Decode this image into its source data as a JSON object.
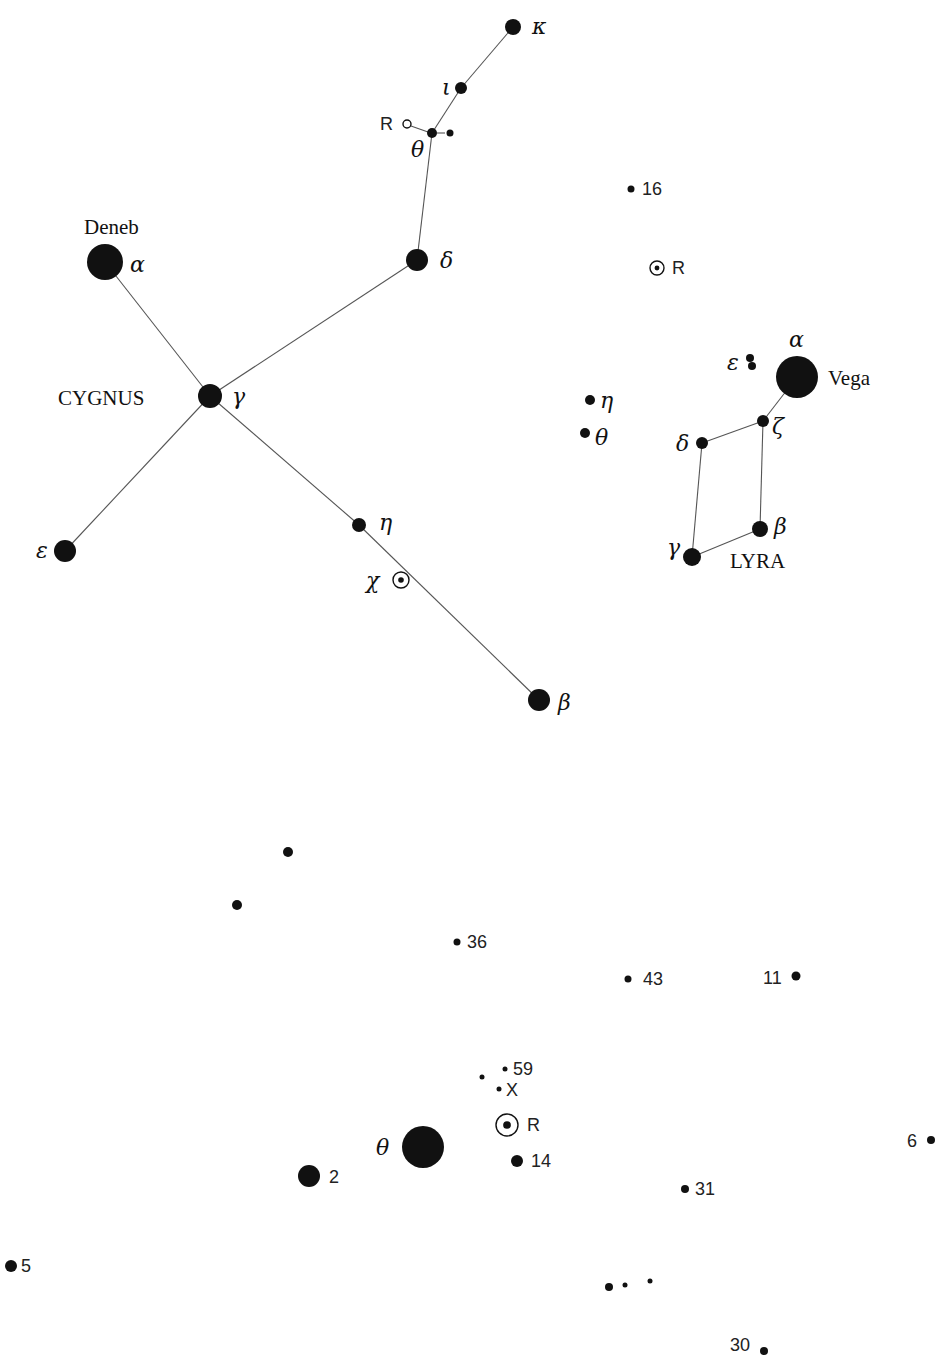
{
  "chart_data": {
    "type": "star-chart",
    "title": "",
    "constellations": [
      {
        "name": "CYGNUS",
        "label_pos": [
          58,
          405
        ],
        "stars": [
          {
            "id": "alpha",
            "label": "α",
            "name": "Deneb",
            "x": 105,
            "y": 262,
            "r": 18,
            "label_pos": [
              130,
              272
            ],
            "name_pos": [
              84,
              234
            ]
          },
          {
            "id": "gamma",
            "label": "γ",
            "x": 210,
            "y": 396,
            "r": 12,
            "label_pos": [
              232,
              404
            ]
          },
          {
            "id": "delta",
            "label": "δ",
            "x": 417,
            "y": 260,
            "r": 11,
            "label_pos": [
              440,
              268
            ]
          },
          {
            "id": "theta",
            "label": "θ",
            "x": 432,
            "y": 133,
            "r": 5,
            "label_pos": [
              411,
              157
            ]
          },
          {
            "id": "theta-companion",
            "label": "",
            "x": 450,
            "y": 133,
            "r": 3.5
          },
          {
            "id": "iota",
            "label": "ι",
            "x": 461,
            "y": 88,
            "r": 6,
            "label_pos": [
              442,
              95
            ]
          },
          {
            "id": "kappa",
            "label": "κ",
            "x": 513,
            "y": 27,
            "r": 8,
            "label_pos": [
              532,
              34
            ]
          },
          {
            "id": "epsilon",
            "label": "ε",
            "x": 65,
            "y": 551,
            "r": 11,
            "label_pos": [
              36,
              558
            ]
          },
          {
            "id": "eta",
            "label": "η",
            "x": 359,
            "y": 525,
            "r": 7,
            "label_pos": [
              379,
              530
            ]
          },
          {
            "id": "beta",
            "label": "β",
            "x": 539,
            "y": 700,
            "r": 11,
            "label_pos": [
              558,
              710
            ]
          }
        ],
        "variable_stars": [
          {
            "id": "R-cyg",
            "label": "R",
            "x": 407,
            "y": 124,
            "r": 4,
            "type": "open",
            "label_pos": [
              380,
              130
            ]
          },
          {
            "id": "chi-cyg",
            "label": "χ",
            "x": 401,
            "y": 580,
            "r": 8,
            "type": "ring-dot",
            "label_pos": [
              366,
              588
            ]
          }
        ],
        "lines": [
          [
            "alpha",
            "gamma"
          ],
          [
            "gamma",
            "delta"
          ],
          [
            "delta",
            "theta"
          ],
          [
            "theta",
            "iota"
          ],
          [
            "iota",
            "kappa"
          ],
          [
            "gamma",
            "epsilon"
          ],
          [
            "gamma",
            "eta"
          ],
          [
            "eta",
            "beta"
          ]
        ]
      },
      {
        "name": "LYRA",
        "label_pos": [
          730,
          568
        ],
        "stars": [
          {
            "id": "alpha",
            "label": "α",
            "name": "Vega",
            "x": 797,
            "y": 377,
            "r": 21,
            "label_pos": [
              789,
              347
            ],
            "name_pos": [
              828,
              385
            ]
          },
          {
            "id": "epsilon",
            "label": "ε",
            "x": 751,
            "y": 362,
            "r": 4,
            "double": true,
            "label_pos": [
              727,
              370
            ]
          },
          {
            "id": "zeta",
            "label": "ζ",
            "x": 763,
            "y": 421,
            "r": 6,
            "label_pos": [
              772,
              434
            ]
          },
          {
            "id": "delta",
            "label": "δ",
            "x": 702,
            "y": 443,
            "r": 6,
            "label_pos": [
              676,
              451
            ]
          },
          {
            "id": "beta",
            "label": "β",
            "x": 760,
            "y": 529,
            "r": 8,
            "label_pos": [
              774,
              534
            ]
          },
          {
            "id": "gamma",
            "label": "γ",
            "x": 692,
            "y": 557,
            "r": 9,
            "label_pos": [
              667,
              555
            ]
          }
        ],
        "lines": [
          [
            "alpha",
            "zeta"
          ],
          [
            "zeta",
            "delta"
          ],
          [
            "zeta",
            "beta"
          ],
          [
            "delta",
            "gamma"
          ],
          [
            "gamma",
            "beta"
          ]
        ]
      }
    ],
    "field_stars": [
      {
        "label": "16",
        "x": 631,
        "y": 189,
        "r": 3.5,
        "label_pos": [
          642,
          195
        ]
      },
      {
        "label": "R",
        "x": 657,
        "y": 268,
        "r": 7,
        "type": "ring-dot",
        "label_pos": [
          672,
          274
        ]
      },
      {
        "label": "η",
        "x": 590,
        "y": 400,
        "r": 5,
        "greek": true,
        "label_pos": [
          600,
          408
        ]
      },
      {
        "label": "θ",
        "x": 585,
        "y": 433,
        "r": 5,
        "greek": true,
        "label_pos": [
          595,
          445
        ]
      },
      {
        "label": "",
        "x": 288,
        "y": 852,
        "r": 5
      },
      {
        "label": "",
        "x": 237,
        "y": 905,
        "r": 5
      },
      {
        "label": "36",
        "x": 457,
        "y": 942,
        "r": 3.5,
        "label_pos": [
          467,
          948
        ]
      },
      {
        "label": "43",
        "x": 628,
        "y": 979,
        "r": 3.5,
        "label_pos": [
          643,
          985
        ]
      },
      {
        "label": "11",
        "x": 796,
        "y": 976,
        "r": 4.5,
        "label_pos": [
          763,
          984
        ],
        "label_left": true
      },
      {
        "label": "59",
        "x": 505,
        "y": 1069,
        "r": 2.5,
        "label_pos": [
          513,
          1075
        ]
      },
      {
        "label": "",
        "x": 482,
        "y": 1077,
        "r": 2.5
      },
      {
        "label": "X",
        "x": 499,
        "y": 1089,
        "r": 2.5,
        "label_pos": [
          506,
          1096
        ]
      },
      {
        "label": "R",
        "x": 507,
        "y": 1125,
        "r": 11,
        "type": "ring-dot",
        "label_pos": [
          527,
          1131
        ]
      },
      {
        "label": "θ",
        "x": 423,
        "y": 1147,
        "r": 21,
        "greek": true,
        "label_pos": [
          376,
          1155
        ]
      },
      {
        "label": "14",
        "x": 517,
        "y": 1161,
        "r": 6,
        "label_pos": [
          531,
          1167
        ]
      },
      {
        "label": "2",
        "x": 309,
        "y": 1176,
        "r": 11,
        "label_pos": [
          329,
          1183
        ]
      },
      {
        "label": "31",
        "x": 685,
        "y": 1189,
        "r": 4,
        "label_pos": [
          695,
          1195
        ]
      },
      {
        "label": "6",
        "x": 931,
        "y": 1140,
        "r": 4,
        "label_pos": [
          907,
          1147
        ],
        "label_left": true
      },
      {
        "label": "5",
        "x": 11,
        "y": 1266,
        "r": 6,
        "label_pos": [
          21,
          1272
        ]
      },
      {
        "label": "",
        "x": 609,
        "y": 1287,
        "r": 4
      },
      {
        "label": "",
        "x": 625,
        "y": 1285,
        "r": 2.5
      },
      {
        "label": "",
        "x": 650,
        "y": 1281,
        "r": 2.5
      },
      {
        "label": "30",
        "x": 764,
        "y": 1351,
        "r": 4,
        "label_pos": [
          730,
          1351
        ],
        "label_left": true
      }
    ]
  }
}
